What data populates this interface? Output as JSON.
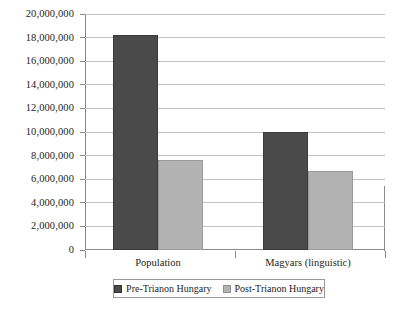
{
  "chart_data": {
    "type": "bar",
    "title": "",
    "xlabel": "",
    "ylabel": "",
    "categories": [
      "Population",
      "Magyars (linguistic)"
    ],
    "series": [
      {
        "name": "Pre-Trianon Hungary",
        "color": "#4a4a4a",
        "values": [
          18200000,
          10000000
        ]
      },
      {
        "name": "Post-Trianon Hungary",
        "color": "#b2b2b2",
        "values": [
          7600000,
          6700000
        ]
      }
    ],
    "ylim": [
      0,
      20000000
    ],
    "ytick_step": 2000000,
    "ytick_labels": [
      "20,000,000",
      "18,000,000",
      "16,000,000",
      "14,000,000",
      "12,000,000",
      "10,000,000",
      "8,000,000",
      "6,000,000",
      "4,000,000",
      "2,000,000",
      "0"
    ],
    "ytick_values": [
      20000000,
      18000000,
      16000000,
      14000000,
      12000000,
      10000000,
      8000000,
      6000000,
      4000000,
      2000000,
      0
    ],
    "grid": true,
    "legend_position": "bottom"
  },
  "legend": {
    "entries": [
      {
        "label": "Pre-Trianon Hungary",
        "swatch": "pre"
      },
      {
        "label": "Post-Trianon Hungary",
        "swatch": "post"
      }
    ]
  }
}
